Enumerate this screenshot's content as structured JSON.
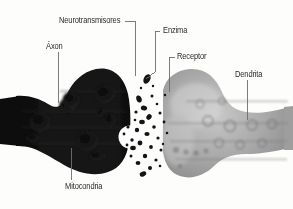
{
  "figure": {
    "background_color": "#fdfdfc",
    "label_color": "#2b2b2b",
    "leader_color": "#6e6e6e"
  },
  "labels": [
    {
      "id": "neurotransmisores",
      "text": "Neurotransmisores"
    },
    {
      "id": "axon",
      "text": "Áxon"
    },
    {
      "id": "enzima",
      "text": "Enzima"
    },
    {
      "id": "receptor",
      "text": "Receptor"
    },
    {
      "id": "dendrita",
      "text": "Dendrita"
    },
    {
      "id": "mitocondria",
      "text": "Mitocondria"
    }
  ],
  "structures": {
    "axon_terminal": {
      "name": "Terminal del axón",
      "color": "#141414"
    },
    "synaptic_cleft": {
      "name": "Hendidura sináptica",
      "color": "#f6f6f4"
    },
    "dendrite": {
      "name": "Dendrita",
      "color": "#9a9a9a"
    },
    "vesicle": {
      "name": "Vesícula sináptica",
      "color": "#ffffff"
    },
    "mitochondria": {
      "name": "Mitocondrias",
      "color": "#080808"
    },
    "neurotransmitter_particles": {
      "name": "Neurotransmisores",
      "color": "#1a1a1a"
    }
  }
}
